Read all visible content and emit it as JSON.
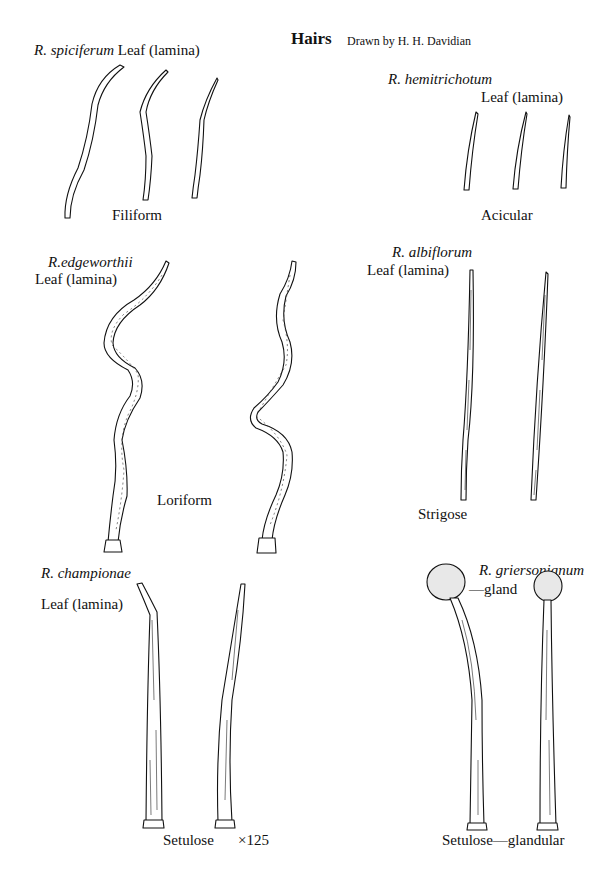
{
  "title": "Hairs",
  "credit": "Drawn by H. H. Davidian",
  "panels": [
    {
      "species": "R. spiciferum",
      "organ": "Leaf (lamina)",
      "type": "Filiform"
    },
    {
      "species": "R. hemitrichotum",
      "organ": "Leaf (lamina)",
      "type": "Acicular"
    },
    {
      "species": "R.edgeworthii",
      "organ": "Leaf (lamina)",
      "type": "Loriform"
    },
    {
      "species": "R. albiflorum",
      "organ": "Leaf (lamina)",
      "type": "Strigose"
    },
    {
      "species": "R. championae",
      "organ": "Leaf (lamina)",
      "type": "Setulose",
      "magnification": "×125"
    },
    {
      "species": "R. griersonianum",
      "annotation": "—gland",
      "type": "Setulose—glandular"
    }
  ]
}
